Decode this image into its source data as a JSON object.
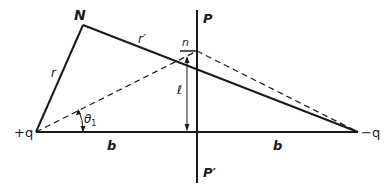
{
  "diagram": {
    "points": {
      "plus_q": {
        "label": "+q",
        "x": 36,
        "y": 132
      },
      "minus_q": {
        "label": "-q",
        "x": 358,
        "y": 132
      },
      "N": {
        "label": "N",
        "x": 83,
        "y": 25
      },
      "n": {
        "label": "n",
        "x": 197,
        "y": 51
      }
    },
    "labels": {
      "N": "N",
      "n": "n",
      "r": "r",
      "r_prime": "r′",
      "P": "P",
      "P_prime": "P′",
      "plus_q": "+q",
      "minus_q": "−q",
      "b_left": "b",
      "b_right": "b",
      "l": "ℓ",
      "theta": "θ",
      "theta_sub": "1"
    },
    "colors": {
      "line": "#1a1a1a",
      "background": "#ffffff"
    }
  }
}
